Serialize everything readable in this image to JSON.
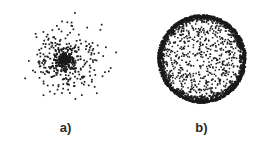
{
  "figure": {
    "width": 267,
    "height": 151,
    "background_color": "#ffffff",
    "point_color": "#1a1a1a",
    "label_color": "#2b2b2b"
  },
  "panels": [
    {
      "id": "a",
      "label": "a)",
      "caption_position": "below",
      "distribution": "gaussian-cluster",
      "center_x": 66,
      "center_y": 60,
      "sigma": 17,
      "core_sigma": 6,
      "n_points": 300,
      "n_core_points": 110,
      "max_radius": 55,
      "dot_size": 1.7,
      "seed": 11
    },
    {
      "id": "b",
      "label": "b)",
      "caption_position": "below",
      "distribution": "uniform-disk-with-dense-rim",
      "center_x": 68,
      "center_y": 59,
      "radius": 44,
      "rim_thickness": 7,
      "n_interior_points": 520,
      "n_rim_points": 1500,
      "dot_size": 1.5,
      "seed": 29
    }
  ],
  "chart_data": {
    "type": "scatter",
    "title": "",
    "subtitle": "",
    "xlabel": "",
    "ylabel": "",
    "grid": false,
    "axes_visible": false,
    "tick_labels": [],
    "legend": [],
    "annotations": [
      "a)",
      "b)"
    ],
    "series": [
      {
        "name": "a)",
        "panel": "a",
        "description": "Two-dimensional normally distributed point cloud: density peaks sharply at the centre and falls off smoothly toward the edges, with isolated outliers scattered far out.",
        "n_points": 300,
        "center": [
          0,
          0
        ],
        "sigma": [
          1,
          1
        ],
        "radial_density_profile": "decreasing",
        "visual_extent_px": {
          "x_min": 15,
          "x_max": 120,
          "y_min": 8,
          "y_max": 115
        }
      },
      {
        "name": "b)",
        "panel": "b",
        "description": "Points drawn uniformly from the surface/boundary region of a disk: the interior is sparse while a thick dark annulus of points accumulates at the circumference.",
        "n_points": 2020,
        "center": [
          0,
          0
        ],
        "radius": 1,
        "radial_density_profile": "increasing-toward-boundary",
        "visual_extent_px": {
          "x_min": 160,
          "x_max": 245,
          "y_min": 15,
          "y_max": 103
        }
      }
    ]
  }
}
